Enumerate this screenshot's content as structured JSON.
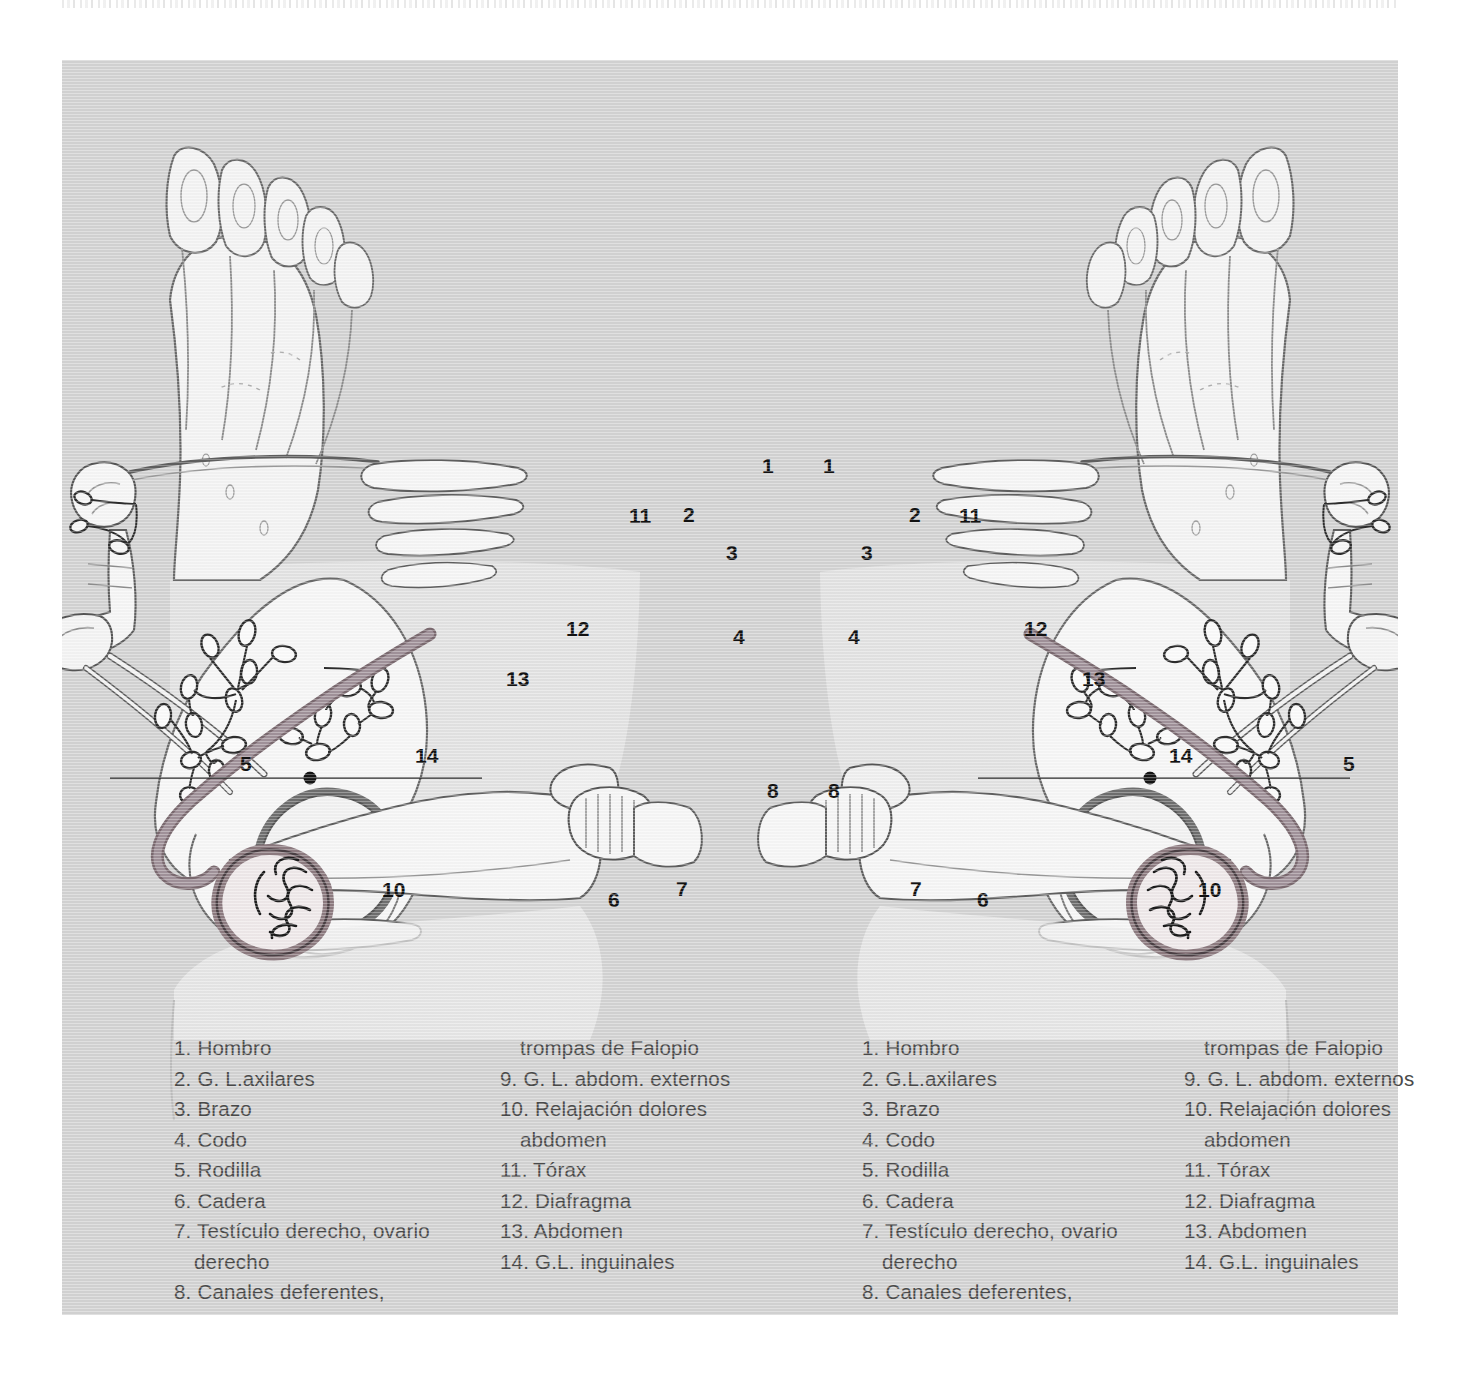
{
  "plate": {
    "background_color": "#d3d3d3",
    "artwork_title": "Diagrama de reflexologia del pie: correspondencias anatomicas"
  },
  "colors": {
    "plate_bg": "#d3d3d3",
    "backdrop_band": "#e4e4e4",
    "bone_fill": "#f4f4f4",
    "bone_outline": "#4a4a4a",
    "duct_tube": "#9e8e93",
    "duct_tube_dark": "#7b6a70",
    "testicle_ring": "#8d7b80",
    "hip_socket": "#6f6f6f",
    "label_text": "#111111",
    "legend_text": "#4a4a4a"
  },
  "callouts": {
    "left_foot": [
      {
        "n": "1",
        "x": 700,
        "y": 394
      },
      {
        "n": "2",
        "x": 621,
        "y": 443
      },
      {
        "n": "3",
        "x": 664,
        "y": 481
      },
      {
        "n": "4",
        "x": 671,
        "y": 565
      },
      {
        "n": "5",
        "x": 178,
        "y": 692
      },
      {
        "n": "6",
        "x": 546,
        "y": 828
      },
      {
        "n": "7",
        "x": 614,
        "y": 817
      },
      {
        "n": "8",
        "x": 705,
        "y": 719
      },
      {
        "n": "10",
        "x": 320,
        "y": 818
      },
      {
        "n": "11",
        "x": 567,
        "y": 444
      },
      {
        "n": "12",
        "x": 504,
        "y": 557
      },
      {
        "n": "13",
        "x": 444,
        "y": 607
      },
      {
        "n": "14",
        "x": 353,
        "y": 684
      }
    ],
    "right_foot": [
      {
        "n": "1",
        "x": 761,
        "y": 394
      },
      {
        "n": "2",
        "x": 847,
        "y": 443
      },
      {
        "n": "3",
        "x": 799,
        "y": 481
      },
      {
        "n": "4",
        "x": 786,
        "y": 565
      },
      {
        "n": "5",
        "x": 1281,
        "y": 692
      },
      {
        "n": "6",
        "x": 915,
        "y": 828
      },
      {
        "n": "7",
        "x": 848,
        "y": 817
      },
      {
        "n": "8",
        "x": 766,
        "y": 719
      },
      {
        "n": "10",
        "x": 1136,
        "y": 818
      },
      {
        "n": "11",
        "x": 897,
        "y": 444
      },
      {
        "n": "12",
        "x": 962,
        "y": 557
      },
      {
        "n": "13",
        "x": 1020,
        "y": 607
      },
      {
        "n": "14",
        "x": 1107,
        "y": 684
      }
    ]
  },
  "legend": {
    "left": {
      "column1": [
        "1. Hombro",
        "2. G. L.axilares",
        "3. Brazo",
        "4. Codo",
        "5. Rodilla",
        "6. Cadera",
        "7. Testículo derecho, ovario",
        "derecho",
        "8. Canales deferentes,"
      ],
      "column1_continuation_index": [
        7
      ],
      "column2": [
        "trompas de Falopio",
        "9. G. L. abdom. externos",
        "10. Relajación dolores",
        "abdomen",
        "11. Tórax",
        "12. Diafragma",
        "13. Abdomen",
        "14. G.L. inguinales"
      ],
      "column2_continuation_index": [
        0,
        3
      ]
    },
    "right": {
      "column1": [
        "1. Hombro",
        "2. G.L.axilares",
        "3. Brazo",
        "4. Codo",
        "5. Rodilla",
        "6. Cadera",
        "7. Testículo derecho, ovario",
        "derecho",
        "8. Canales deferentes,"
      ],
      "column1_continuation_index": [
        7
      ],
      "column2": [
        "trompas de Falopio",
        "9. G. L. abdom. externos",
        "10. Relajación dolores",
        "abdomen",
        "11. Tórax",
        "12. Diafragma",
        "13. Abdomen",
        "14. G.L. inguinales"
      ],
      "column2_continuation_index": [
        0,
        3
      ]
    }
  }
}
